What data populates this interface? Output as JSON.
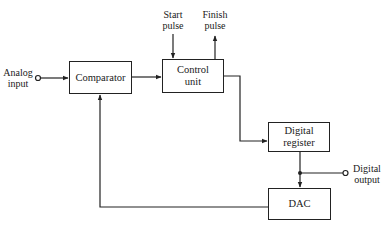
{
  "diagram": {
    "type": "block-diagram",
    "title": "",
    "blocks": {
      "comparator": {
        "label": "Comparator"
      },
      "control_unit": {
        "label": "Control\nunit"
      },
      "digital_register": {
        "label": "Digital\nregister"
      },
      "dac": {
        "label": "DAC"
      }
    },
    "terminals": {
      "analog_input": {
        "label": "Analog\ninput"
      },
      "start_pulse": {
        "label": "Start\npulse"
      },
      "finish_pulse": {
        "label": "Finish\npulse"
      },
      "digital_output": {
        "label": "Digital\noutput"
      }
    },
    "connections": [
      {
        "from": "analog_input",
        "to": "comparator"
      },
      {
        "from": "comparator",
        "to": "control_unit"
      },
      {
        "from": "start_pulse",
        "to": "control_unit"
      },
      {
        "from": "control_unit",
        "to": "finish_pulse"
      },
      {
        "from": "control_unit",
        "to": "digital_register"
      },
      {
        "from": "digital_register",
        "to": "digital_output"
      },
      {
        "from": "digital_register",
        "to": "dac"
      },
      {
        "from": "dac",
        "to": "comparator"
      }
    ]
  }
}
